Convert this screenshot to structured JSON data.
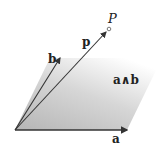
{
  "diagram": {
    "labels": {
      "a": "a",
      "b": "b",
      "p": "p",
      "P": "P",
      "wedge": "a∧b"
    },
    "colors": {
      "line": "#333333",
      "fill_dark": "#b8b8b8",
      "fill_light": "#ffffff"
    }
  }
}
